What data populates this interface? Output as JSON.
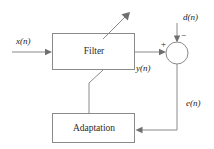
{
  "diagram": {
    "background_color": "#ffffff",
    "line_color": "#8a8a8a",
    "text_color": "#1a1a1a",
    "blocks": [
      {
        "id": "filter",
        "label": "Filter",
        "x": 52,
        "y": 33,
        "w": 83,
        "h": 37
      },
      {
        "id": "adaptation",
        "label": "Adaptation",
        "x": 52,
        "y": 113,
        "w": 83,
        "h": 30
      }
    ],
    "nodes": [
      {
        "id": "summing-junction",
        "cx": 177,
        "cy": 53,
        "r": 11
      }
    ],
    "signals": [
      {
        "id": "input",
        "label": "x(n)",
        "x": 16,
        "y": 44
      },
      {
        "id": "desired",
        "label": "d(n)",
        "x": 183,
        "y": 20
      },
      {
        "id": "output",
        "label": "y(n)",
        "x": 136,
        "y": 71
      },
      {
        "id": "error",
        "label": "e(n)",
        "x": 186,
        "y": 106
      }
    ],
    "signs": [
      {
        "id": "plus",
        "label": "+",
        "x": 161,
        "y": 47
      },
      {
        "id": "minus",
        "label": "−",
        "x": 181,
        "y": 38
      }
    ]
  }
}
